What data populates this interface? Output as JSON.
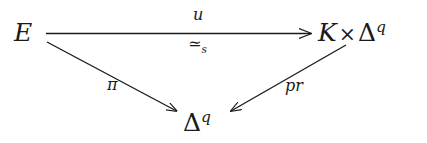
{
  "diagram": {
    "type": "commutative-triangle",
    "background_color": "#ffffff",
    "ink_color": "#1a1a1a",
    "nodes": [
      {
        "id": "E",
        "label": "E",
        "role": "source-object",
        "position": "top-left"
      },
      {
        "id": "KxDq",
        "label": "K × Δ",
        "superscript": "q",
        "factors": [
          "K",
          "Δ^q"
        ],
        "product_symbol": "×",
        "role": "target-object",
        "position": "top-right"
      },
      {
        "id": "Dq",
        "label": "Δ",
        "superscript": "q",
        "role": "base-object",
        "position": "bottom-center"
      }
    ],
    "edges": [
      {
        "id": "u",
        "from": "E",
        "to": "KxDq",
        "label_above": "u",
        "label_below_symbol": "≃",
        "label_below_subscript": "s",
        "direction": "right",
        "style": "solid",
        "arrowhead": "end"
      },
      {
        "id": "pi",
        "from": "E",
        "to": "Dq",
        "label": "π",
        "direction": "down-right",
        "style": "solid",
        "arrowhead": "end"
      },
      {
        "id": "pr",
        "from": "KxDq",
        "to": "Dq",
        "label": "pr",
        "direction": "down-left",
        "style": "solid",
        "arrowhead": "end"
      }
    ]
  }
}
